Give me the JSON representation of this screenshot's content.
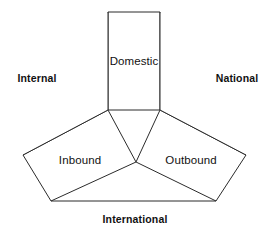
{
  "diagram": {
    "type": "tourism-triangle-diagram",
    "background_color": "#ffffff",
    "line_color": "#2b2b2b",
    "text_color": "#111111",
    "regions": [
      {
        "key": "domestic",
        "label": "Domestic",
        "shape": "rectangle",
        "label_x": 134,
        "label_y": 62,
        "points": "108,12 160,12 160,110 108,110"
      },
      {
        "key": "inbound",
        "label": "Inbound",
        "shape": "quadrilateral",
        "label_x": 80,
        "label_y": 161,
        "points": "108,110 136,162 51,201 23,155"
      },
      {
        "key": "outbound",
        "label": "Outbound",
        "shape": "quadrilateral",
        "label_x": 191,
        "label_y": 161,
        "points": "160,110 246,155 216,201 136,162"
      }
    ],
    "outer_edges": [
      {
        "key": "left-wing",
        "points": "108,12 108,110 23,155"
      },
      {
        "key": "right-wing",
        "points": "160,12 160,110 246,155"
      },
      {
        "key": "bottom-edge",
        "points": "51,201 216,201"
      }
    ],
    "axis_labels": [
      {
        "key": "internal",
        "label": "Internal",
        "x": 37,
        "y": 78,
        "position": "left"
      },
      {
        "key": "national",
        "label": "National",
        "x": 237,
        "y": 78,
        "position": "right"
      },
      {
        "key": "international",
        "label": "International",
        "x": 135,
        "y": 219,
        "position": "bottom"
      }
    ]
  }
}
